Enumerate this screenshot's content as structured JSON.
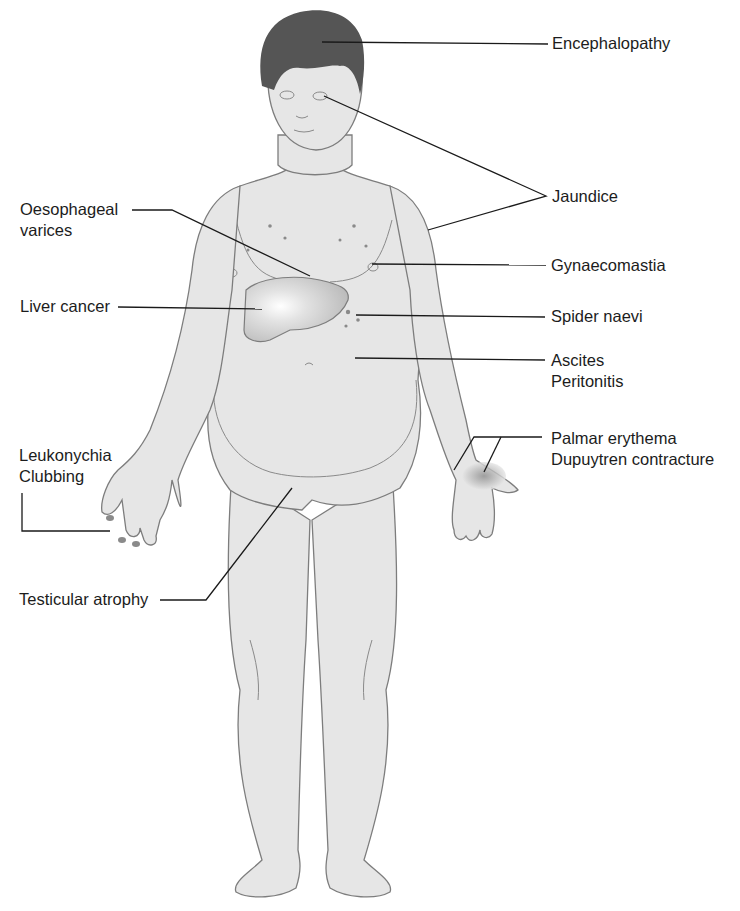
{
  "figure": {
    "labels": [
      {
        "id": "encephalopathy",
        "lines": [
          "Encephalopathy"
        ],
        "target": "head"
      },
      {
        "id": "jaundice",
        "lines": [
          "Jaundice"
        ],
        "target": "eyes and skin"
      },
      {
        "id": "oesophageal-varices",
        "lines": [
          "Oesophageal",
          "varices"
        ],
        "target": "oesophagus"
      },
      {
        "id": "gynaecomastia",
        "lines": [
          "Gynaecomastia"
        ],
        "target": "chest"
      },
      {
        "id": "liver-cancer",
        "lines": [
          "Liver cancer"
        ],
        "target": "liver"
      },
      {
        "id": "spider-naevi",
        "lines": [
          "Spider naevi"
        ],
        "target": "upper abdomen skin"
      },
      {
        "id": "ascites-peritonitis",
        "lines": [
          "Ascites",
          "Peritonitis"
        ],
        "target": "abdomen"
      },
      {
        "id": "leukonychia-clubbing",
        "lines": [
          "Leukonychia",
          "Clubbing"
        ],
        "target": "right fingernails"
      },
      {
        "id": "palmar-erythema",
        "lines": [
          "Palmar erythema",
          "Dupuytren contracture"
        ],
        "target": "left palm"
      },
      {
        "id": "testicular-atrophy",
        "lines": [
          "Testicular atrophy"
        ],
        "target": "testes"
      }
    ]
  },
  "colors": {
    "skin": "#e6e6e6",
    "outline": "#7d7d7d",
    "hair": "#555555",
    "liver": "#c8c8c8",
    "leader": "#1a1a1a",
    "background": "#ffffff"
  }
}
